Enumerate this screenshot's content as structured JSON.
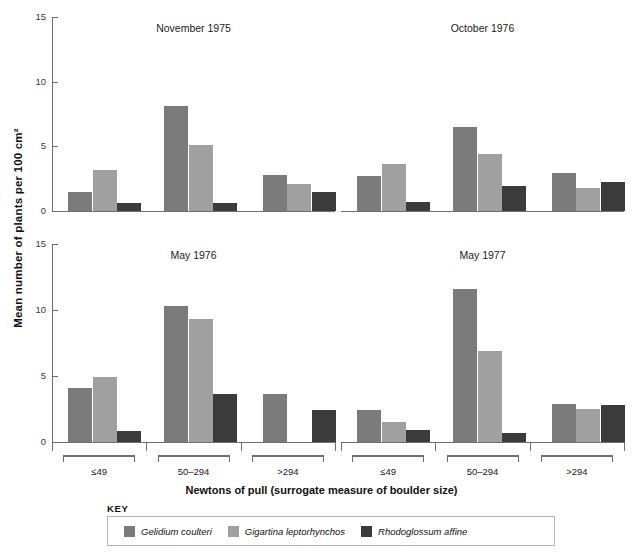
{
  "figure": {
    "ylabel": "Mean number of plants per 100 cm²",
    "xlabel": "Newtons of pull (surrogate measure of boulder size)",
    "key_title": "KEY"
  },
  "legend": {
    "items": [
      {
        "label": "Gelidium coulteri",
        "color": "#7b7b7b",
        "name": "legend-gelidium-coulteri"
      },
      {
        "label": "Gigartina leptorhynchos",
        "color": "#a0a0a0",
        "name": "legend-gigartina-leptorhynchos"
      },
      {
        "label": "Rhodoglossum affine",
        "color": "#3b3b3b",
        "name": "legend-rhodoglossum-affine"
      }
    ]
  },
  "yticks": [
    "0",
    "5",
    "10",
    "15"
  ],
  "group_labels": [
    "≤49",
    "50–294",
    ">294"
  ],
  "chart_data": {
    "type": "bar",
    "title": "",
    "xlabel": "Newtons of pull (surrogate measure of boulder size)",
    "ylabel": "Mean number of plants per 100 cm²",
    "ylim": [
      0,
      15
    ],
    "yticks": [
      0,
      5,
      10,
      15
    ],
    "grid": false,
    "legend_position": "bottom",
    "categories": [
      "≤49",
      "50–294",
      ">294"
    ],
    "panels": [
      {
        "title": "November 1975",
        "position": "top-left",
        "series": [
          {
            "name": "Gelidium coulteri",
            "color": "#7b7b7b",
            "values": [
              1.5,
              8.1,
              2.8
            ]
          },
          {
            "name": "Gigartina leptorhynchos",
            "color": "#a0a0a0",
            "values": [
              3.2,
              5.1,
              2.1
            ]
          },
          {
            "name": "Rhodoglossum affine",
            "color": "#3b3b3b",
            "values": [
              0.6,
              0.65,
              1.5
            ]
          }
        ]
      },
      {
        "title": "October 1976",
        "position": "top-right",
        "series": [
          {
            "name": "Gelidium coulteri",
            "color": "#7b7b7b",
            "values": [
              2.7,
              6.5,
              2.9
            ]
          },
          {
            "name": "Gigartina leptorhynchos",
            "color": "#a0a0a0",
            "values": [
              3.6,
              4.4,
              1.8
            ]
          },
          {
            "name": "Rhodoglossum affine",
            "color": "#3b3b3b",
            "values": [
              0.7,
              1.9,
              2.25
            ]
          }
        ]
      },
      {
        "title": "May 1976",
        "position": "bottom-left",
        "series": [
          {
            "name": "Gelidium coulteri",
            "color": "#7b7b7b",
            "values": [
              4.1,
              10.3,
              3.6
            ]
          },
          {
            "name": "Gigartina leptorhynchos",
            "color": "#a0a0a0",
            "values": [
              4.95,
              9.3,
              0
            ]
          },
          {
            "name": "Rhodoglossum affine",
            "color": "#3b3b3b",
            "values": [
              0.8,
              3.6,
              2.4
            ]
          }
        ]
      },
      {
        "title": "May 1977",
        "position": "bottom-right",
        "series": [
          {
            "name": "Gelidium coulteri",
            "color": "#7b7b7b",
            "values": [
              2.4,
              11.6,
              2.9
            ]
          },
          {
            "name": "Gigartina leptorhynchos",
            "color": "#a0a0a0",
            "values": [
              1.5,
              6.9,
              2.5
            ]
          },
          {
            "name": "Rhodoglossum affine",
            "color": "#3b3b3b",
            "values": [
              0.9,
              0.7,
              2.8
            ]
          }
        ]
      }
    ]
  }
}
